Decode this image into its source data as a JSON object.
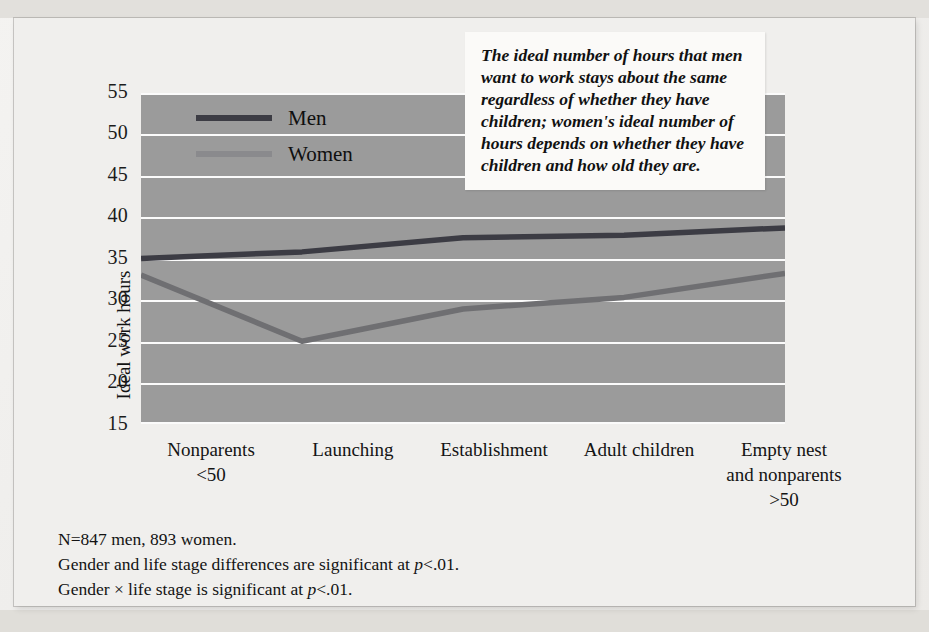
{
  "chart_data": {
    "type": "line",
    "title": "",
    "xlabel": "",
    "ylabel": "Ideal work hours",
    "categories": [
      "Nonparents\n<50",
      "Launching",
      "Establishment",
      "Adult children",
      "Empty nest\nand nonparents\n>50"
    ],
    "ylim": [
      15,
      55
    ],
    "yticks": [
      55,
      50,
      45,
      40,
      35,
      30,
      25,
      20,
      15
    ],
    "grid": true,
    "legend_position": "inside-top-left",
    "series": [
      {
        "name": "Men",
        "values": [
          35.0,
          35.8,
          37.5,
          37.8,
          38.7
        ],
        "color": "#3c3c44"
      },
      {
        "name": "Women",
        "values": [
          33.0,
          25.0,
          28.9,
          30.3,
          33.2
        ],
        "color": "#6f6f72"
      }
    ],
    "annotation": "The ideal number of hours that men want to work stays about the same regardless of whether they have children; women's ideal number of hours depends on whether they have children and how old they are.",
    "notes": [
      "N=847 men, 893 women.",
      "Gender and life stage differences are significant at p<.01.",
      "Gender × life stage is significant at p<.01."
    ]
  },
  "axis": {
    "y_title": "Ideal work hours",
    "y_ticks": [
      "55",
      "50",
      "45",
      "40",
      "35",
      "30",
      "25",
      "20",
      "15"
    ],
    "x_labels": [
      "Nonparents\n<50",
      "Launching",
      "Establishment",
      "Adult children",
      "Empty nest\nand nonparents\n>50"
    ]
  },
  "legend": {
    "items": [
      {
        "label": "Men",
        "color": "#3c3c44"
      },
      {
        "label": "Women",
        "color": "#6f6f72"
      }
    ]
  },
  "annotation": {
    "text": "The ideal number of hours that men want to work stays about the same regardless of whether they have children; women's ideal number of hours depends on whether they have children and how old they are."
  },
  "footnotes": {
    "line1": "N=847 men, 893 women.",
    "line2_a": "Gender and life stage differences are significant at ",
    "line2_p": "p",
    "line2_b": "<.01.",
    "line3_a": "Gender × life stage is significant at ",
    "line3_p": "p",
    "line3_b": "<.01."
  },
  "colors": {
    "plot_background": "#9b9b9b",
    "gridline": "#fbfbfb",
    "page_background": "#f0efed",
    "men_line": "#3c3c44",
    "women_line": "#6f6f72"
  }
}
